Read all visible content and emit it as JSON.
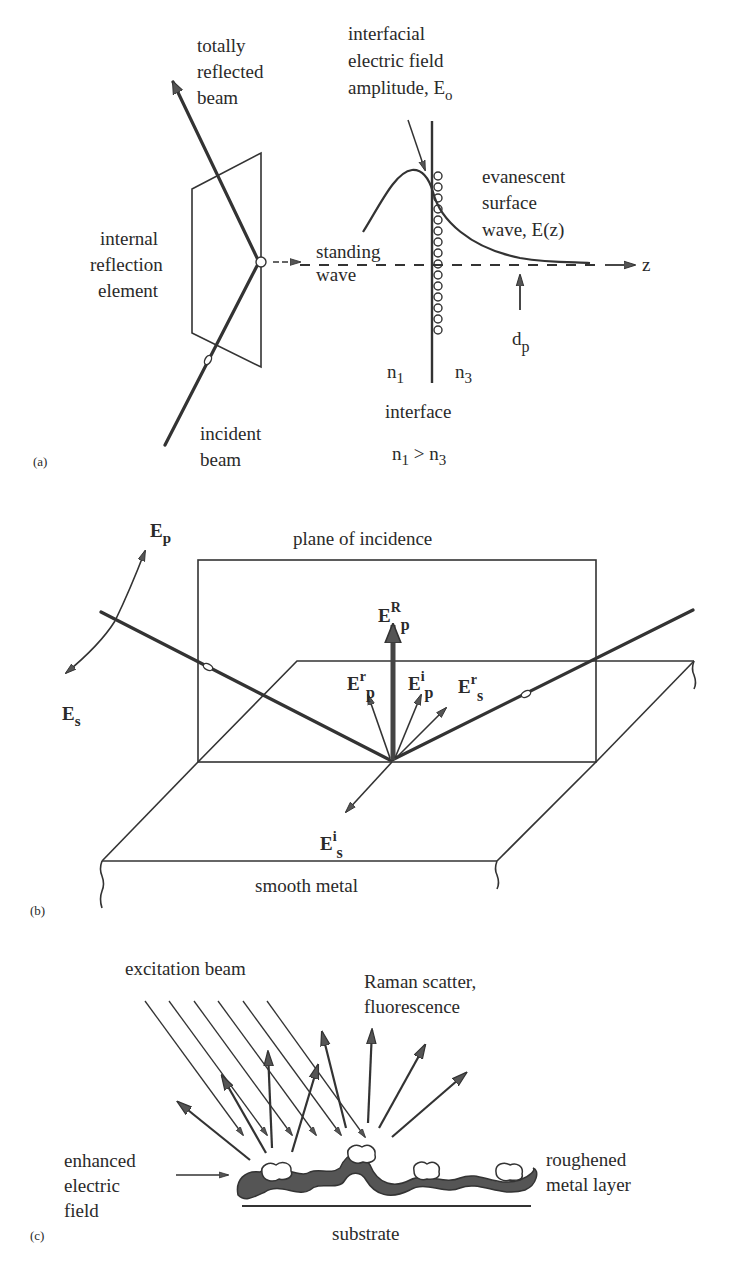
{
  "figure": {
    "panels": [
      {
        "id": "a",
        "tag": "(a)",
        "labels": {
          "reflected_l1": "totally",
          "reflected_l2": "reflected",
          "reflected_l3": "beam",
          "ire_l1": "internal",
          "ire_l2": "reflection",
          "ire_l3": "element",
          "incident_l1": "incident",
          "incident_l2": "beam",
          "interfacial_l1": "interfacial",
          "interfacial_l2": "electric field",
          "interfacial_l3": "amplitude, E",
          "interfacial_sub": "o",
          "evanescent_l1": "evanescent",
          "evanescent_l2": "surface",
          "evanescent_l3": "wave, E(z)",
          "standing_l1": "standing",
          "standing_l2": "wave",
          "z_axis": "z",
          "dp": "d",
          "dp_sub": "p",
          "n1": "n",
          "n1_sub": "1",
          "n3": "n",
          "n3_sub": "3",
          "interface": "interface",
          "condition_n1": "n",
          "condition_n1_sub": "1",
          "condition_gt": " > n",
          "condition_n3_sub": "3"
        }
      },
      {
        "id": "b",
        "tag": "(b)",
        "labels": {
          "plane": "plane of incidence",
          "Ep": "E",
          "Ep_sub": "p",
          "Es": "E",
          "Es_sub": "s",
          "ERp": "E",
          "ERp_sup": "R",
          "ERp_sub": "p",
          "Erp": "E",
          "Erp_sup": "r",
          "Erp_sub": "p",
          "Eip": "E",
          "Eip_sup": "i",
          "Eip_sub": "p",
          "Ers": "E",
          "Ers_sup": "r",
          "Ers_sub": "s",
          "Eis": "E",
          "Eis_sup": "i",
          "Eis_sub": "s",
          "metal": "smooth metal"
        }
      },
      {
        "id": "c",
        "tag": "(c)",
        "labels": {
          "excitation": "excitation beam",
          "raman_l1": "Raman scatter,",
          "raman_l2": "fluorescence",
          "enhanced_l1": "enhanced",
          "enhanced_l2": "electric",
          "enhanced_l3": "field",
          "roughened_l1": "roughened",
          "roughened_l2": "metal layer",
          "substrate": "substrate"
        }
      }
    ]
  }
}
